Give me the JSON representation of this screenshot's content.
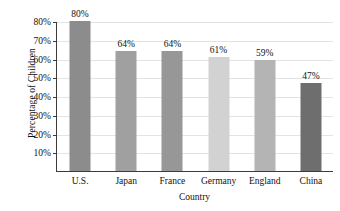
{
  "chart_data": {
    "type": "bar",
    "title": "",
    "xlabel": "Country",
    "ylabel": "Percentage of Children",
    "categories": [
      "U.S.",
      "Japan",
      "France",
      "Germany",
      "England",
      "China"
    ],
    "values": [
      80,
      64,
      64,
      61,
      59,
      47
    ],
    "value_labels": [
      "80%",
      "64%",
      "64%",
      "61%",
      "59%",
      "47%"
    ],
    "bar_colors": [
      "#8c8c8c",
      "#a0a0a0",
      "#979797",
      "#d2d2d2",
      "#b4b4b4",
      "#6e6e6e"
    ],
    "ylim": [
      0,
      80
    ],
    "ytick_values": [
      10,
      20,
      30,
      40,
      50,
      60,
      70,
      80
    ],
    "ytick_labels": [
      "10%",
      "20%",
      "30%",
      "40%",
      "50%",
      "60%",
      "70%",
      "80%"
    ],
    "grid": true,
    "grid_axis": "y",
    "legend": "none",
    "axis_color": "#3c3c3c",
    "grid_color": "#e3e3e3",
    "background": "#ffffff"
  }
}
